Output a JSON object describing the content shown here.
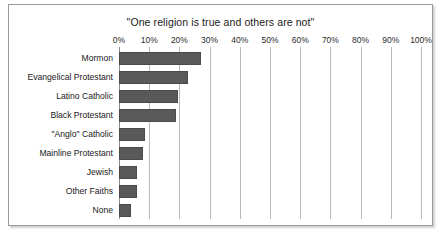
{
  "chart_data": {
    "type": "bar",
    "orientation": "horizontal",
    "title": "\"One religion is true and others are not\"",
    "xlabel": "",
    "ylabel": "",
    "categories": [
      "Mormon",
      "Evangelical Protestant",
      "Latino Catholic",
      "Black Protestant",
      "\"Anglo\" Catholic",
      "Mainline Protestant",
      "Jewish",
      "Other Faiths",
      "None"
    ],
    "values": [
      27,
      23,
      19.5,
      19,
      8.5,
      8,
      6,
      6,
      4
    ],
    "xlim": [
      0,
      100
    ],
    "xtick_labels": [
      "0%",
      "10%",
      "20%",
      "30%",
      "40%",
      "50%",
      "60%",
      "70%",
      "80%",
      "90%",
      "100%"
    ],
    "xticks": [
      0,
      10,
      20,
      30,
      40,
      50,
      60,
      70,
      80,
      90,
      100
    ],
    "grid": "vertical",
    "legend": null,
    "bar_color": "#595959",
    "bar_border_color": "#4a4a4a",
    "gridline_color": "#b9b9b9",
    "frame_color": "#9a9a9a",
    "background": "#ffffff"
  }
}
